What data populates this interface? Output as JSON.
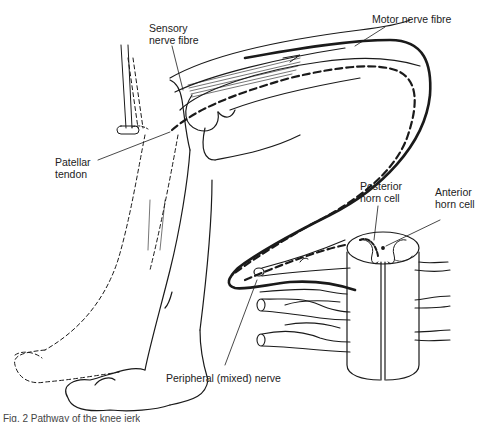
{
  "figure": {
    "labels": {
      "sensory_nerve_fibre": [
        "Sensory",
        "nerve fibre"
      ],
      "motor_nerve_fibre": "Motor nerve fibre",
      "patellar_tendon": [
        "Patellar",
        "tendon"
      ],
      "posterior_horn_cell": [
        "Posterior",
        "horn cell"
      ],
      "anterior_horn_cell": [
        "Anterior",
        "horn cell"
      ],
      "peripheral_mixed_nerve": "Peripheral (mixed) nerve"
    },
    "caption": "Fig. 2  Pathway of the knee jerk",
    "colors": {
      "ink": "#1a1a1a",
      "background": "#ffffff",
      "label_text": "#222222"
    }
  }
}
